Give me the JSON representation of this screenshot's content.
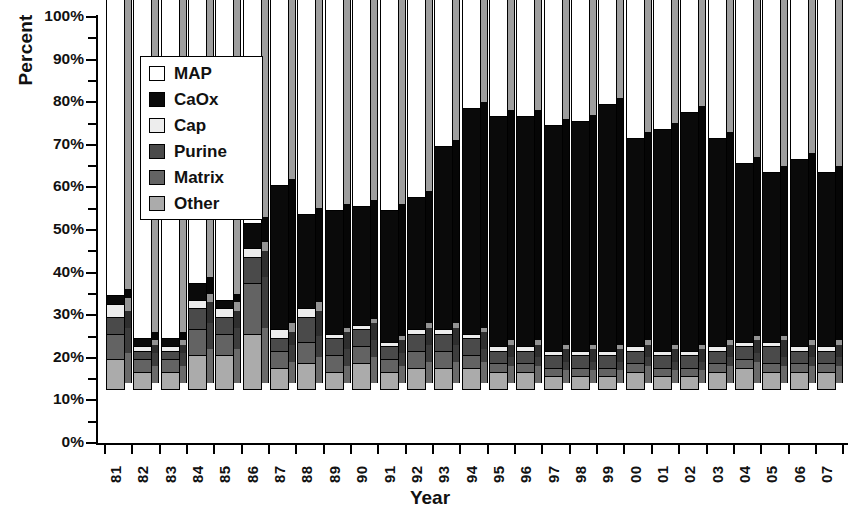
{
  "chart_data": {
    "type": "bar",
    "subtype": "100% stacked bar (3D)",
    "title": "",
    "xlabel": "Year",
    "ylabel": "Percent",
    "ylim": [
      0,
      100
    ],
    "ytick_labels": [
      "0%",
      "10%",
      "20%",
      "30%",
      "40%",
      "50%",
      "60%",
      "70%",
      "80%",
      "90%",
      "100%"
    ],
    "ytick_values": [
      0,
      10,
      20,
      30,
      40,
      50,
      60,
      70,
      80,
      90,
      100
    ],
    "minor_ticks": true,
    "grid": false,
    "legend_position": "upper-left-inside",
    "stack_order_bottom_to_top": [
      "Other",
      "Matrix",
      "Purine",
      "Cap",
      "CaOx",
      "MAP"
    ],
    "categories": [
      "81",
      "82",
      "83",
      "84",
      "85",
      "86",
      "87",
      "88",
      "89",
      "90",
      "91",
      "92",
      "93",
      "94",
      "95",
      "96",
      "97",
      "98",
      "99",
      "00",
      "01",
      "02",
      "03",
      "04",
      "05",
      "06",
      "07"
    ],
    "series": [
      {
        "name": "MAP",
        "color": "#ffffff",
        "values": [
          78,
          88,
          88,
          75,
          79,
          61,
          52,
          59,
          58,
          57,
          58,
          55,
          43,
          34,
          36,
          36,
          38,
          37,
          33,
          41,
          39,
          35,
          41,
          47,
          49,
          46,
          49
        ]
      },
      {
        "name": "CaOx",
        "color": "#0a0a0a",
        "values": [
          2,
          2,
          2,
          4,
          2,
          6,
          34,
          22,
          29,
          28,
          31,
          31,
          43,
          53,
          54,
          54,
          53,
          54,
          58,
          49,
          52,
          56,
          49,
          42,
          40,
          44,
          41
        ]
      },
      {
        "name": "Cap",
        "color": "#ededed",
        "values": [
          3,
          1,
          1,
          2,
          2,
          2,
          2,
          2,
          1,
          1,
          1,
          1,
          1,
          1,
          1,
          1,
          1,
          1,
          1,
          1,
          1,
          1,
          1,
          1,
          1,
          1,
          1
        ]
      },
      {
        "name": "Purine",
        "color": "#4a4a4a",
        "values": [
          4,
          2,
          2,
          5,
          4,
          6,
          3,
          6,
          4,
          4,
          3,
          4,
          4,
          4,
          3,
          3,
          3,
          3,
          3,
          3,
          3,
          3,
          3,
          3,
          4,
          3,
          3
        ]
      },
      {
        "name": "Matrix",
        "color": "#636363",
        "values": [
          6,
          3,
          3,
          6,
          5,
          12,
          4,
          5,
          4,
          4,
          3,
          4,
          4,
          3,
          2,
          2,
          2,
          2,
          2,
          2,
          2,
          2,
          2,
          2,
          2,
          2,
          2
        ]
      },
      {
        "name": "Other",
        "color": "#ababab",
        "values": [
          7,
          4,
          4,
          8,
          8,
          13,
          5,
          6,
          4,
          6,
          4,
          5,
          5,
          5,
          4,
          4,
          3,
          3,
          3,
          4,
          3,
          3,
          4,
          5,
          4,
          4,
          4
        ]
      }
    ]
  },
  "legend": {
    "items": [
      {
        "label": "MAP",
        "color": "#ffffff"
      },
      {
        "label": "CaOx",
        "color": "#0a0a0a"
      },
      {
        "label": "Cap",
        "color": "#ededed"
      },
      {
        "label": "Purine",
        "color": "#4a4a4a"
      },
      {
        "label": "Matrix",
        "color": "#636363"
      },
      {
        "label": "Other",
        "color": "#ababab"
      }
    ]
  },
  "axes": {
    "y_title": "Percent",
    "x_title": "Year"
  }
}
